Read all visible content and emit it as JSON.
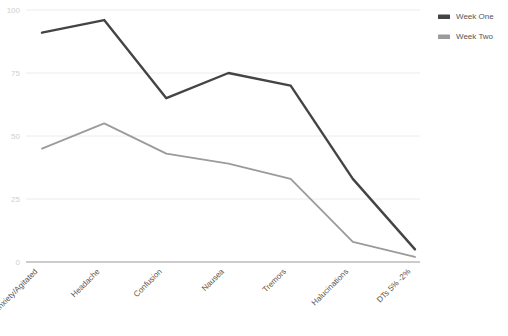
{
  "chart_data": {
    "type": "line",
    "title": "",
    "subtitle": "",
    "xlabel": "",
    "ylabel": "",
    "ylim": [
      0,
      100
    ],
    "yticks": [
      0,
      25,
      50,
      75,
      100
    ],
    "ytick_labels": [
      "0",
      "25",
      "50",
      "75",
      "100"
    ],
    "grid": true,
    "legend_position": "top-right",
    "categories": [
      "Anxiety/Agitated",
      "Headache",
      "Confusion",
      "Nausea",
      "Tremors",
      "Halucinations",
      "DTs 5% -2%"
    ],
    "series": [
      {
        "name": "Week One",
        "color": "#444444",
        "values": [
          91,
          96,
          65,
          75,
          70,
          33,
          5
        ]
      },
      {
        "name": "Week Two",
        "color": "#9b9b9b",
        "values": [
          45,
          55,
          43,
          39,
          33,
          8,
          2
        ]
      }
    ]
  },
  "legend": {
    "items": [
      {
        "label": "Week One",
        "color": "#444444"
      },
      {
        "label": "Week Two",
        "color": "#9b9b9b"
      }
    ]
  },
  "axes": {
    "y_tick_labels": [
      "100",
      "75",
      "50",
      "25",
      "0"
    ],
    "x_tick_labels": [
      "Anxiety/Agitated",
      "Headache",
      "Confusion",
      "Nausea",
      "Tremors",
      "Halucinations",
      "DTs 5% -2%"
    ]
  },
  "colors": {
    "gridline": "#ececec",
    "axis_line": "#9a9a9a",
    "ytick_text": "#cfcfcf",
    "xtick_text": "#555555",
    "series_one": "#444444",
    "series_two": "#9b9b9b"
  }
}
